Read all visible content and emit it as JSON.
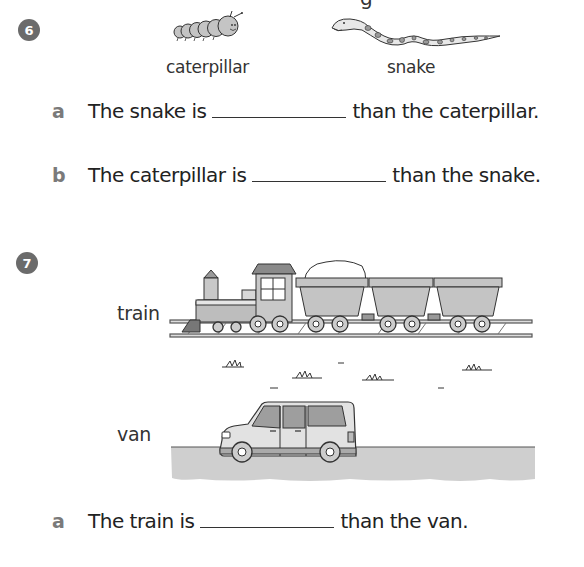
{
  "header": {
    "cutoff_text": "g"
  },
  "question6": {
    "number": "6",
    "items": [
      {
        "label": "caterpillar",
        "icon": "caterpillar-icon"
      },
      {
        "label": "snake",
        "icon": "snake-icon"
      }
    ],
    "parts": [
      {
        "letter": "a",
        "before": "The snake is",
        "after": "than the caterpillar.",
        "answer": ""
      },
      {
        "letter": "b",
        "before": "The caterpillar is",
        "after": "than the snake.",
        "answer": ""
      }
    ]
  },
  "question7": {
    "number": "7",
    "items": [
      {
        "label": "train",
        "icon": "train-icon"
      },
      {
        "label": "van",
        "icon": "van-icon"
      }
    ],
    "parts": [
      {
        "letter": "a",
        "before": "The train is",
        "after": "than the van.",
        "answer": ""
      }
    ]
  }
}
